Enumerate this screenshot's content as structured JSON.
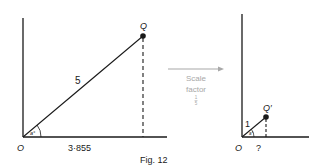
{
  "figure": {
    "caption": "Fig. 12",
    "left_diagram": {
      "origin_label": "O",
      "point_label": "Q",
      "hypotenuse_label": "5",
      "base_label": "3·855",
      "angle_label": "a°"
    },
    "transform": {
      "line1": "Scale",
      "line2": "factor",
      "fraction_numerator": "1",
      "fraction_denominator": "5"
    },
    "right_diagram": {
      "origin_label": "O",
      "point_label": "Q′",
      "hypotenuse_label": "1",
      "base_label": "?",
      "angle_label": "a°"
    },
    "colors": {
      "ink": "#1a1a1a",
      "arrow": "#a8a8a8"
    }
  }
}
